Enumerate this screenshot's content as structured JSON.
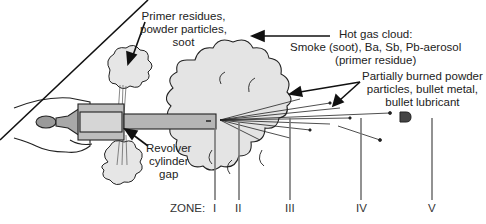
{
  "diagram": {
    "type": "gunshot residue zones illustration",
    "labels": {
      "primer_residues": [
        "Primer residues,",
        "powder particles,",
        "soot"
      ],
      "hot_gas_cloud": [
        "Hot gas cloud:",
        "Smoke (soot), Ba, Sb, Pb-aerosol",
        "(primer residue)"
      ],
      "partially_burned": [
        "Partially burned powder",
        "particles, bullet metal,",
        "bullet lubricant"
      ],
      "cylinder_gap": [
        "Revolver",
        "cylinder",
        "gap"
      ]
    },
    "zone_label": "ZONE:",
    "zones": [
      "I",
      "II",
      "III",
      "IV",
      "V"
    ],
    "colors": {
      "cloud_fill": "#e4e4e4",
      "gun_fill": "#b5b5b5",
      "line": "#222222",
      "zone_line": "#777777"
    }
  }
}
